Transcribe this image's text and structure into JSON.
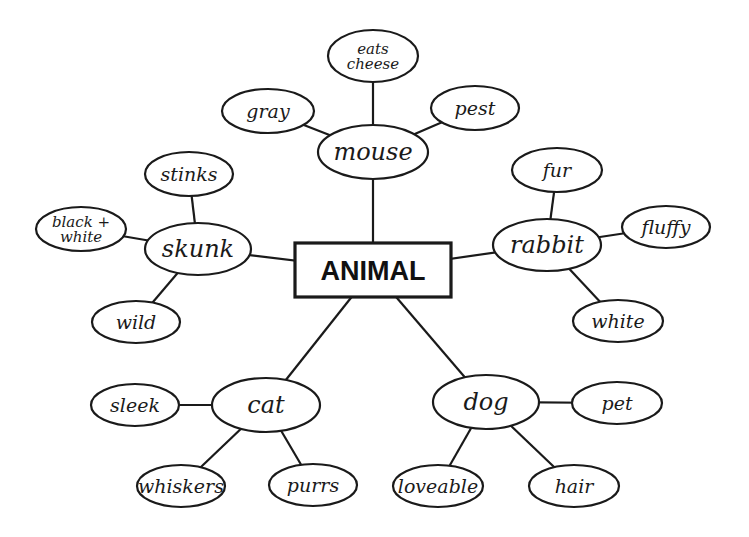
{
  "diagram": {
    "type": "concept-map",
    "root": {
      "id": "animal",
      "label": "ANIMAL",
      "x": 373,
      "y": 270,
      "w": 156,
      "h": 54
    },
    "categories": [
      {
        "id": "mouse",
        "label": "mouse",
        "x": 373,
        "y": 152,
        "rx": 55,
        "ry": 27,
        "attributes": [
          {
            "id": "eats-cheese",
            "label": "eats cheese",
            "lines": [
              "eats",
              "cheese"
            ],
            "x": 373,
            "y": 56,
            "rx": 45,
            "ry": 26
          },
          {
            "id": "gray",
            "label": "gray",
            "x": 268,
            "y": 111,
            "rx": 46,
            "ry": 22
          },
          {
            "id": "pest",
            "label": "pest",
            "x": 475,
            "y": 108,
            "rx": 44,
            "ry": 22
          }
        ]
      },
      {
        "id": "skunk",
        "label": "skunk",
        "x": 198,
        "y": 249,
        "rx": 53,
        "ry": 26,
        "attributes": [
          {
            "id": "stinks",
            "label": "stinks",
            "x": 189,
            "y": 174,
            "rx": 44,
            "ry": 22
          },
          {
            "id": "black-white",
            "label": "black + white",
            "lines": [
              "black +",
              "white"
            ],
            "x": 81,
            "y": 229,
            "rx": 45,
            "ry": 22
          },
          {
            "id": "wild",
            "label": "wild",
            "x": 136,
            "y": 322,
            "rx": 44,
            "ry": 21
          }
        ]
      },
      {
        "id": "rabbit",
        "label": "rabbit",
        "x": 547,
        "y": 245,
        "rx": 54,
        "ry": 26,
        "attributes": [
          {
            "id": "fur",
            "label": "fur",
            "x": 557,
            "y": 170,
            "rx": 45,
            "ry": 22
          },
          {
            "id": "fluffy",
            "label": "fluffy",
            "x": 666,
            "y": 227,
            "rx": 44,
            "ry": 21
          },
          {
            "id": "white",
            "label": "white",
            "x": 618,
            "y": 321,
            "rx": 45,
            "ry": 21
          }
        ]
      },
      {
        "id": "cat",
        "label": "cat",
        "x": 266,
        "y": 405,
        "rx": 54,
        "ry": 27,
        "attributes": [
          {
            "id": "sleek",
            "label": "sleek",
            "x": 135,
            "y": 405,
            "rx": 44,
            "ry": 21
          },
          {
            "id": "whiskers",
            "label": "whiskers",
            "x": 181,
            "y": 486,
            "rx": 44,
            "ry": 21
          },
          {
            "id": "purrs",
            "label": "purrs",
            "x": 313,
            "y": 485,
            "rx": 44,
            "ry": 21
          }
        ]
      },
      {
        "id": "dog",
        "label": "dog",
        "x": 486,
        "y": 402,
        "rx": 53,
        "ry": 27,
        "attributes": [
          {
            "id": "pet",
            "label": "pet",
            "x": 617,
            "y": 403,
            "rx": 45,
            "ry": 21
          },
          {
            "id": "loveable",
            "label": "loveable",
            "x": 438,
            "y": 486,
            "rx": 45,
            "ry": 21
          },
          {
            "id": "hair",
            "label": "hair",
            "x": 574,
            "y": 486,
            "rx": 45,
            "ry": 21
          }
        ]
      }
    ],
    "colors": {
      "ink": "#1a1a1a",
      "background": "#ffffff"
    }
  }
}
